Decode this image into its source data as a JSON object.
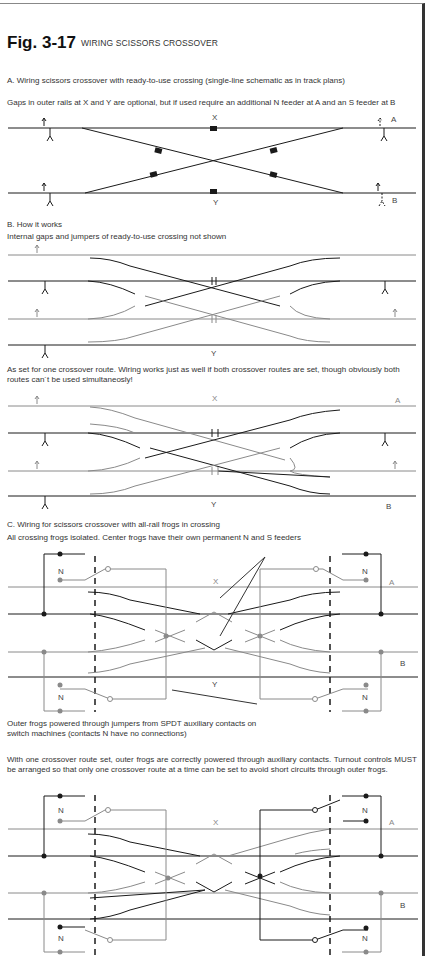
{
  "figure": {
    "number": "Fig. 3-17",
    "title": "WIRING SCISSORS CROSSOVER"
  },
  "sections": {
    "a": {
      "heading": "A. Wiring scissors crossover with ready-to-use crossing (single-line schematic as in track plans)",
      "note": "Gaps in outer rails at X and Y are optional, but if used require an additional N feeder at A and an S feeder at B",
      "labels": {
        "x": "X",
        "y": "Y",
        "a": "A",
        "b": "B"
      }
    },
    "b": {
      "heading": "B. How it works",
      "note": "Internal gaps and jumpers of ready-to-use crossing not shown",
      "labels": {
        "y": "Y"
      },
      "note2": "As set for one crossover route. Wiring works just as well if both crossover routes are set, though obviously both routes can´t be used simultaneosly!",
      "labels2": {
        "x": "X",
        "y": "Y",
        "a": "A",
        "b": "B"
      }
    },
    "c": {
      "heading": "C. Wiring for scissors crossover with all-rail frogs in crossing",
      "note": "All crossing frogs isolated. Center frogs have their own permanent N and S feeders",
      "labels": {
        "x": "X",
        "y": "Y",
        "a": "A",
        "b": "B",
        "n": "N"
      },
      "caption": "Outer frogs powered through jumpers from SPDT auxiliary contacts on switch machines (contacts N have no connections)",
      "note2": "With one crossover route set, outer frogs are correctly powered through auxiliary contacts. Turnout controls MUST be arranged so that only one crossover route at a time can be set to avoid short circuits through outer frogs.",
      "labels2": {
        "x": "X",
        "a": "A",
        "b": "B",
        "n": "N"
      }
    }
  },
  "colors": {
    "black_rail": "#1a1a1a",
    "gray_rail": "#8a8a8a",
    "border": "#333333"
  }
}
